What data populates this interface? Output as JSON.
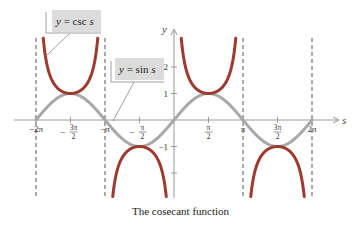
{
  "chart_data": {
    "type": "line",
    "title": "The cosecant function",
    "xlabel": "s",
    "ylabel": "y",
    "xlim": [
      -6.2832,
      6.2832
    ],
    "ylim": [
      -3,
      3
    ],
    "grid": false,
    "x_ticks": [
      "-2π",
      "-3π/2",
      "-π",
      "-π/2",
      "π/2",
      "π",
      "3π/2",
      "2π"
    ],
    "y_ticks": [
      "2",
      "1",
      "-1",
      "-2"
    ],
    "asymptotes": [
      "-2π",
      "-π",
      "π",
      "2π"
    ],
    "series": [
      {
        "name": "y = csc s",
        "color": "#9e3a32",
        "function": "csc(s)",
        "key_points": [
          {
            "x": "-3π/2",
            "y": 1
          },
          {
            "x": "-π/2",
            "y": -1
          },
          {
            "x": "π/2",
            "y": 1
          },
          {
            "x": "3π/2",
            "y": -1
          }
        ]
      },
      {
        "name": "y = sin s",
        "color": "#a8a8a8",
        "function": "sin(s)",
        "key_points": [
          {
            "x": "-2π",
            "y": 0
          },
          {
            "x": "-3π/2",
            "y": 1
          },
          {
            "x": "-π",
            "y": 0
          },
          {
            "x": "-π/2",
            "y": -1
          },
          {
            "x": "0",
            "y": 0
          },
          {
            "x": "π/2",
            "y": 1
          },
          {
            "x": "π",
            "y": 0
          },
          {
            "x": "3π/2",
            "y": -1
          },
          {
            "x": "2π",
            "y": 0
          }
        ]
      }
    ],
    "legend": "callout labels"
  },
  "labels": {
    "csc": {
      "prefix": "y",
      "eq": " = csc ",
      "var": "s"
    },
    "sin": {
      "prefix": "y",
      "eq": " = sin ",
      "var": "s"
    }
  },
  "axes": {
    "x_name": "s",
    "y_name": "y",
    "x_ticks": [
      {
        "pos": -6.2832,
        "whole": "−2π"
      },
      {
        "pos": -4.7124,
        "num": "3π",
        "den": "2",
        "neg": true
      },
      {
        "pos": -3.1416,
        "whole": "−π"
      },
      {
        "pos": -1.5708,
        "num": "π",
        "den": "2",
        "neg": true
      },
      {
        "pos": 1.5708,
        "num": "π",
        "den": "2"
      },
      {
        "pos": 3.1416,
        "whole": "π"
      },
      {
        "pos": 4.7124,
        "num": "3π",
        "den": "2"
      },
      {
        "pos": 6.2832,
        "whole": "2π"
      }
    ],
    "y_ticks": [
      {
        "pos": 2,
        "text": "2"
      },
      {
        "pos": 1,
        "text": "1"
      },
      {
        "pos": -1,
        "text": "−1"
      },
      {
        "pos": -2,
        "text": ""
      }
    ]
  },
  "colors": {
    "csc": "#9e3a32",
    "sin": "#a8a8a8",
    "axis": "#999999",
    "asymptote": "#555555",
    "label_bg": "#dcdcdc"
  },
  "caption": "The cosecant function"
}
